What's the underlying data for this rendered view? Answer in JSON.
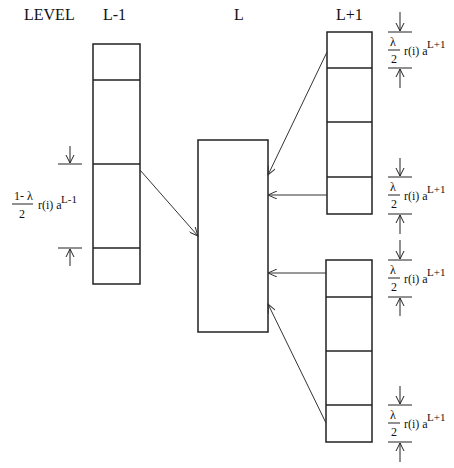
{
  "headers": {
    "level": "LEVEL",
    "left": "L-1",
    "middle": "L",
    "right": "L+1"
  },
  "annotations": {
    "left": {
      "numerator": "1- λ",
      "denominator": "2",
      "body": "r(i) a",
      "superscript": "L-1"
    },
    "right": [
      {
        "numerator": "λ",
        "denominator": "2",
        "body": "r(i) a",
        "superscript": "L+1"
      },
      {
        "numerator": "λ",
        "denominator": "2",
        "body": "r(i) a",
        "superscript": "L+1"
      },
      {
        "numerator": "λ",
        "denominator": "2",
        "body": "r(i) a",
        "superscript": "L+1"
      },
      {
        "numerator": "λ",
        "denominator": "2",
        "body": "r(i) a",
        "superscript": "L+1"
      }
    ]
  },
  "colors": {
    "stroke": "#222222",
    "arrow": "#333333"
  }
}
